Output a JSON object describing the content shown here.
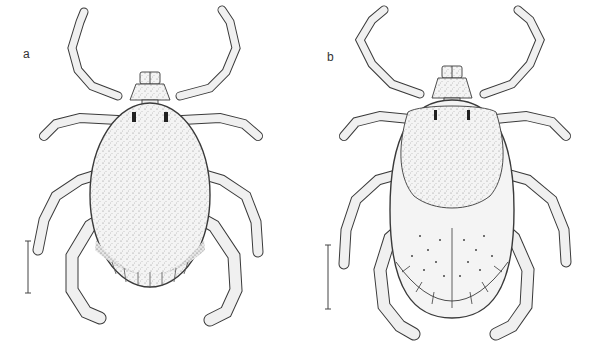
{
  "figure": {
    "panels": [
      {
        "label": "a",
        "subject": "tick-dorsal-view-engorged-scutum",
        "x": 23,
        "y": 55
      },
      {
        "label": "b",
        "subject": "tick-dorsal-view-male-festooned",
        "x": 327,
        "y": 58
      }
    ],
    "scale_bars": [
      {
        "panel": "a",
        "x": 28,
        "y1": 241,
        "y2": 293
      },
      {
        "panel": "b",
        "x": 328,
        "y1": 245,
        "y2": 309
      }
    ],
    "colors": {
      "ink": "#3a3a3a",
      "fill": "#f2f2f2",
      "stipple": "#555555"
    }
  }
}
